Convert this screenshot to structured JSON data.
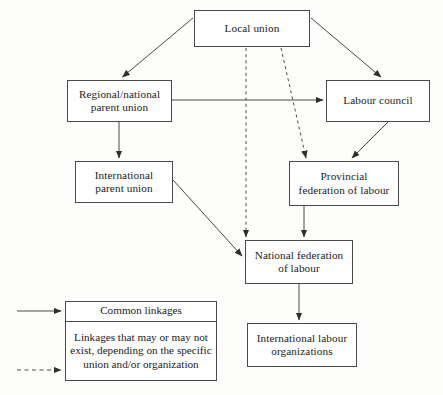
{
  "diagram": {
    "nodes": [
      {
        "id": "local",
        "label": "Local union"
      },
      {
        "id": "regional",
        "label": "Regional/national\nparent union",
        "line1": "Regional/national",
        "line2": "parent union"
      },
      {
        "id": "council",
        "label": "Labour council"
      },
      {
        "id": "intl_parent",
        "label": "International\nparent union",
        "line1": "International",
        "line2": "parent union"
      },
      {
        "id": "provincial",
        "label": "Provincial\nfederation of labour",
        "line1": "Provincial",
        "line2": "federation of labour"
      },
      {
        "id": "national_fed",
        "label": "National federation\nof labour",
        "line1": "National federation",
        "line2": "of labour"
      },
      {
        "id": "ilo",
        "label": "International labour\norganizations",
        "line1": "International labour",
        "line2": "organizations"
      }
    ],
    "edges": [
      {
        "from": "local",
        "to": "regional",
        "style": "solid"
      },
      {
        "from": "local",
        "to": "council",
        "style": "solid"
      },
      {
        "from": "local",
        "to": "national_fed",
        "style": "dashed"
      },
      {
        "from": "local",
        "to": "provincial",
        "style": "dashed"
      },
      {
        "from": "regional",
        "to": "council",
        "style": "solid"
      },
      {
        "from": "regional",
        "to": "intl_parent",
        "style": "solid"
      },
      {
        "from": "council",
        "to": "provincial",
        "style": "solid"
      },
      {
        "from": "intl_parent",
        "to": "national_fed",
        "style": "solid"
      },
      {
        "from": "provincial",
        "to": "national_fed",
        "style": "solid"
      },
      {
        "from": "national_fed",
        "to": "ilo",
        "style": "solid"
      }
    ],
    "colors": {
      "line": "#4a4a4a",
      "box_border": "#4a4a4a",
      "background": "#fdfdfb",
      "text": "#1b1b1b"
    }
  },
  "legend": {
    "rows": [
      {
        "key": "solid-arrow",
        "text": "Common linkages"
      },
      {
        "key": "dashed-arrow",
        "text": "Linkages that may or may not exist, depending on the specific union and/or organization"
      }
    ]
  },
  "caption": {
    "text": ""
  }
}
